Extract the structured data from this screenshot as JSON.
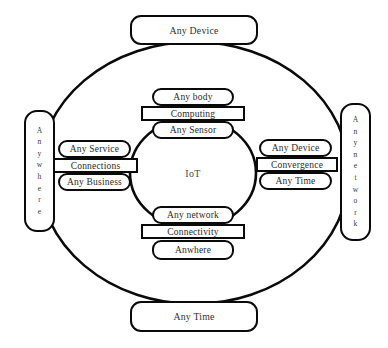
{
  "diagram": {
    "center": {
      "label": "IoT"
    },
    "outer": {
      "top": {
        "label": "Any Device"
      },
      "bottom": {
        "label": "Any Time"
      },
      "left": {
        "label": "Anywhere",
        "letters": [
          "A",
          "n",
          "y",
          "w",
          "h",
          "e",
          "r",
          "e"
        ]
      },
      "right": {
        "label": "Anynetwork",
        "letters": [
          "A",
          "n",
          "y",
          "n",
          "e",
          "t",
          "w",
          "o",
          "r",
          "k"
        ]
      }
    },
    "clusters": {
      "top": [
        {
          "label": "Any body",
          "shape": "rounded"
        },
        {
          "label": "Computing",
          "shape": "bar"
        },
        {
          "label": "Any Sensor",
          "shape": "rounded"
        }
      ],
      "left": [
        {
          "label": "Any Service",
          "shape": "rounded"
        },
        {
          "label": "Connections",
          "shape": "bar"
        },
        {
          "label": "Any Business",
          "shape": "rounded"
        }
      ],
      "right": [
        {
          "label": "Any Device",
          "shape": "rounded"
        },
        {
          "label": "Convergence",
          "shape": "bar"
        },
        {
          "label": "Any Time",
          "shape": "rounded"
        }
      ],
      "bottom": [
        {
          "label": "Any network",
          "shape": "rounded"
        },
        {
          "label": "Connectivity",
          "shape": "bar"
        },
        {
          "label": "Anwhere",
          "shape": "rounded"
        }
      ]
    },
    "colors": {
      "stroke": "#0a0a0a",
      "fill": "#ffffff",
      "text": "#2b2b2b",
      "background": "#ffffff"
    }
  }
}
